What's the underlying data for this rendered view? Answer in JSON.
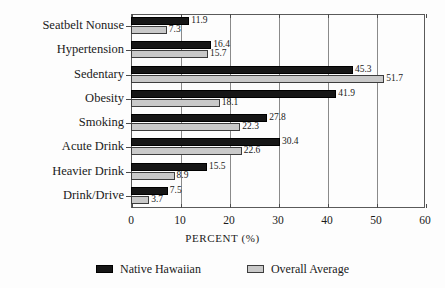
{
  "chart_data": {
    "type": "bar",
    "orientation": "horizontal",
    "title": "",
    "xlabel": "PERCENT (%)",
    "ylabel": "",
    "xlim": [
      0,
      60
    ],
    "xticks": [
      0,
      10,
      20,
      30,
      40,
      50,
      60
    ],
    "xtick_labels": [
      "0",
      "10",
      "20",
      "30",
      "40",
      "50",
      "60"
    ],
    "grid": true,
    "grid_axis": "x",
    "legend_position": "bottom",
    "categories": [
      "Seatbelt Nonuse",
      "Hypertension",
      "Sedentary",
      "Obesity",
      "Smoking",
      "Acute Drink",
      "Heavier Drink",
      "Drink/Drive"
    ],
    "series": [
      {
        "name": "Native Hawaiian",
        "color": "#161616",
        "values": [
          11.9,
          16.4,
          45.3,
          41.9,
          27.8,
          30.4,
          15.5,
          7.5
        ],
        "value_labels": [
          "11.9",
          "16.4",
          "45.3",
          "41.9",
          "27.8",
          "30.4",
          "15.5",
          "7.5"
        ]
      },
      {
        "name": "Overall Average",
        "color": "#c9c9c9",
        "values": [
          7.3,
          15.7,
          51.7,
          18.1,
          22.3,
          22.6,
          8.9,
          3.7
        ],
        "value_labels": [
          "7.3",
          "15.7",
          "51.7",
          "18.1",
          "22.3",
          "22.6",
          "8.9",
          "3.7"
        ]
      }
    ]
  },
  "legend": {
    "items": [
      {
        "label": "Native Hawaiian",
        "swatch": "black-swatch-icon"
      },
      {
        "label": "Overall Average",
        "swatch": "gray-swatch-icon"
      }
    ]
  },
  "axis": {
    "x_title": "PERCENT (%)"
  }
}
